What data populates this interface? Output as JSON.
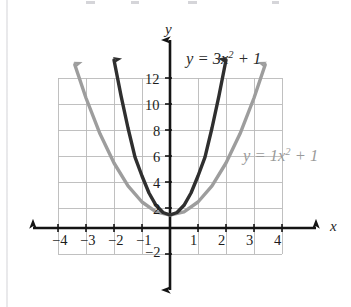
{
  "figure": {
    "kind": "cartesian-graph",
    "background": "#ffffff",
    "grid_color": "#b9b9b9",
    "axis_color": "#1a1a1a"
  },
  "axes": {
    "x_axis_name": "x",
    "y_axis_name": "y",
    "x_ticks": [
      "-4",
      "-3",
      "-2",
      "-1",
      "1",
      "2",
      "3",
      "4"
    ],
    "y_ticks": [
      "12",
      "10",
      "8",
      "6",
      "4",
      "2",
      "-2"
    ]
  },
  "labels": {
    "dark_curve": {
      "lhs": "y",
      "eq": "=",
      "coef": "3",
      "var": "x",
      "exp": "2",
      "plus": "+",
      "const": "1",
      "color": "#2b2b2b"
    },
    "light_curve": {
      "lhs": "y",
      "eq": "=",
      "coef": "1",
      "var": "x",
      "exp": "2",
      "plus": "+",
      "const": "1",
      "color": "#9a9a9a"
    }
  },
  "chart_data": {
    "type": "line",
    "title": "",
    "xlabel": "x",
    "ylabel": "y",
    "xlim": [
      -4,
      4
    ],
    "ylim": [
      -2,
      12
    ],
    "grid": true,
    "x_tick_values": [
      -4,
      -3,
      -2,
      -1,
      1,
      2,
      3,
      4
    ],
    "y_tick_values": [
      12,
      10,
      8,
      6,
      4,
      2,
      -2
    ],
    "legend": "inline-annotations",
    "series": [
      {
        "name": "y = 3x^2 + 1",
        "equation": "y = 3x^2 + 1",
        "color": "#2b2b2b",
        "vertex": [
          0,
          1
        ],
        "x": [
          -2.0,
          -1.75,
          -1.5,
          -1.25,
          -1.0,
          -0.75,
          -0.5,
          -0.25,
          0,
          0.25,
          0.5,
          0.75,
          1.0,
          1.25,
          1.5,
          1.75,
          2.0
        ],
        "y": [
          13.0,
          10.19,
          7.75,
          5.69,
          4.0,
          2.69,
          1.75,
          1.19,
          1.0,
          1.19,
          1.75,
          2.69,
          4.0,
          5.69,
          7.75,
          10.19,
          13.0
        ]
      },
      {
        "name": "y = 1x^2 + 1",
        "equation": "y = 1x^2 + 1",
        "color": "#9a9a9a",
        "vertex": [
          0,
          1
        ],
        "x": [
          -3.4,
          -3.0,
          -2.5,
          -2.0,
          -1.5,
          -1.0,
          -0.5,
          0,
          0.5,
          1.0,
          1.5,
          2.0,
          2.5,
          3.0,
          3.4
        ],
        "y": [
          12.56,
          10.0,
          7.25,
          5.0,
          3.25,
          2.0,
          1.25,
          1.0,
          1.25,
          2.0,
          3.25,
          5.0,
          7.25,
          10.0,
          12.56
        ]
      }
    ]
  },
  "tick_positions": {
    "x": [
      {
        "label": "-4",
        "left": 52,
        "top": 233
      },
      {
        "label": "-3",
        "left": 80,
        "top": 233
      },
      {
        "label": "-2",
        "left": 108,
        "top": 233
      },
      {
        "label": "-1",
        "left": 136,
        "top": 233
      },
      {
        "label": "1",
        "left": 190,
        "top": 233
      },
      {
        "label": "2",
        "left": 218,
        "top": 233
      },
      {
        "label": "3",
        "left": 246,
        "top": 233
      },
      {
        "label": "4",
        "left": 274,
        "top": 233
      }
    ],
    "y": [
      {
        "label": "12",
        "left": 145,
        "top": 72
      },
      {
        "label": "10",
        "left": 145,
        "top": 98
      },
      {
        "label": "8",
        "left": 153,
        "top": 124
      },
      {
        "label": "6",
        "left": 153,
        "top": 150
      },
      {
        "label": "4",
        "left": 153,
        "top": 176
      },
      {
        "label": "2",
        "left": 153,
        "top": 202
      },
      {
        "label": "-2",
        "left": 145,
        "top": 245
      }
    ]
  }
}
